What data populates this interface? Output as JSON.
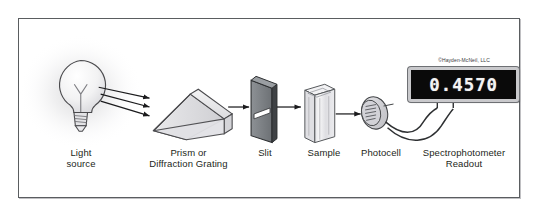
{
  "figure": {
    "copyright": "©Hayden-McNeil, LLC",
    "border_color": "#5a5d60",
    "background_color": "#ffffff",
    "label_color": "#231f20"
  },
  "components": [
    {
      "id": "light-source",
      "label": "Light\nsource"
    },
    {
      "id": "prism",
      "label": "Prism or\nDiffraction Grating"
    },
    {
      "id": "slit",
      "label": "Slit"
    },
    {
      "id": "sample",
      "label": "Sample"
    },
    {
      "id": "photocell",
      "label": "Photocell"
    },
    {
      "id": "readout",
      "label": "Spectrophotometer\nReadout"
    }
  ],
  "readout": {
    "value": "0.4570",
    "screen_color": "#0a0a0a",
    "digit_color": "#f4f4f4",
    "bezel_color": "#c9c9cc"
  }
}
